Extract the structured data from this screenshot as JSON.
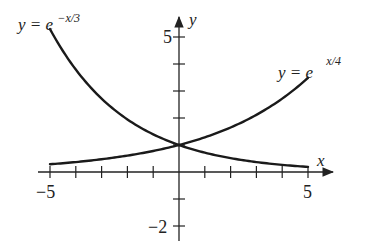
{
  "chart_data": {
    "type": "line",
    "title": "",
    "xlabel": "x",
    "ylabel": "y",
    "xlim": [
      -5,
      5
    ],
    "ylim": [
      -2,
      5
    ],
    "x_tick_labels": [
      "-5",
      "5"
    ],
    "y_tick_labels": [
      "5",
      "-2"
    ],
    "x_ticks": [
      -5,
      -4,
      -3,
      -2,
      -1,
      1,
      2,
      3,
      4,
      5
    ],
    "y_ticks": [
      -2,
      -1,
      1,
      2,
      3,
      4,
      5
    ],
    "grid": false,
    "series": [
      {
        "name": "y = e^{-x/3}",
        "label_base": "y = e",
        "label_exp": "−x/3",
        "x": [
          -5,
          -4,
          -3,
          -2,
          -1,
          0,
          1,
          2,
          3,
          4,
          5
        ],
        "values": [
          5.29,
          3.79,
          2.72,
          1.95,
          1.4,
          1.0,
          0.72,
          0.51,
          0.37,
          0.26,
          0.19
        ]
      },
      {
        "name": "y = e^{x/4}",
        "label_base": "y = e",
        "label_exp": "x/4",
        "x": [
          -5,
          -4,
          -3,
          -2,
          -1,
          0,
          1,
          2,
          3,
          4,
          5
        ],
        "values": [
          0.29,
          0.37,
          0.47,
          0.61,
          0.78,
          1.0,
          1.28,
          1.65,
          2.12,
          2.72,
          3.49
        ]
      }
    ],
    "annotations": [
      "intersection at (0, 1)"
    ]
  },
  "labels": {
    "x_axis": "x",
    "y_axis": "y",
    "x_min": "−5",
    "x_max": "5",
    "y_max": "5",
    "y_min": "−2",
    "curve1_base": "y = e",
    "curve1_exp": "−x/3",
    "curve2_base": "y = e",
    "curve2_exp": "x/4"
  }
}
